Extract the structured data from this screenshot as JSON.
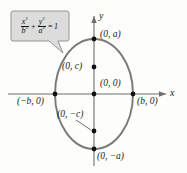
{
  "figure": {
    "type": "ellipse-diagram",
    "orientation": "vertical-major-axis",
    "center": {
      "x": 94,
      "y": 94
    },
    "semi_minor_b_px": 39,
    "semi_major_a_px": 55,
    "focal_distance_c_px": 27,
    "colors": {
      "curve": "#7a7a7a",
      "axis": "#6e6e6e",
      "marker": "#111111",
      "callout_fill": "#dcdcdc",
      "callout_border": "#8a8a8a",
      "text": "#1a1a1a",
      "background": "#fdfdfc"
    }
  },
  "equation": {
    "term1": {
      "numerator": "x",
      "numerator_exp": "2",
      "denominator": "b",
      "denominator_exp": "2"
    },
    "operator": "+",
    "term2": {
      "numerator": "y",
      "numerator_exp": "2",
      "denominator": "a",
      "denominator_exp": "2"
    },
    "equals": "=",
    "right_hand_side": "1",
    "plain": "x²/b² + y²/a² = 1"
  },
  "axes": {
    "x_label": "x",
    "y_label": "y"
  },
  "points": [
    {
      "id": "top-vertex",
      "label": "(0, a)",
      "marker": true,
      "leader": false
    },
    {
      "id": "upper-focus",
      "label": "(0, c)",
      "marker": true,
      "leader": false
    },
    {
      "id": "origin",
      "label": "(0, 0)",
      "marker": true,
      "leader": false
    },
    {
      "id": "left-vertex",
      "label": "(−b, 0)",
      "marker": true,
      "leader": false
    },
    {
      "id": "right-vertex",
      "label": "(b, 0)",
      "marker": true,
      "leader": false
    },
    {
      "id": "lower-focus",
      "label": "(0, −c)",
      "marker": true,
      "leader": true
    },
    {
      "id": "bottom-vertex",
      "label": "(0, −a)",
      "marker": true,
      "leader": false
    }
  ]
}
